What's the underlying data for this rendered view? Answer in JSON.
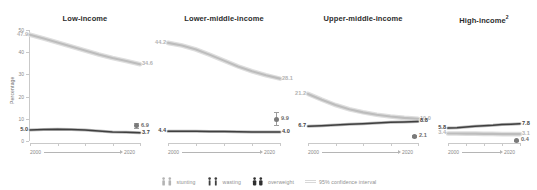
{
  "figure": {
    "ylabel": "Percentage",
    "yticks": [
      0,
      10,
      20,
      30,
      40,
      50
    ],
    "xstart_label": "2000",
    "xend_label": "2020"
  },
  "legend": {
    "items": [
      {
        "label": "stunting",
        "icon": "two-short-people-icon",
        "color": "#b3b3b3"
      },
      {
        "label": "wasting",
        "icon": "two-thin-people-icon",
        "color": "#3f3f3f"
      },
      {
        "label": "overweight",
        "icon": "two-wide-people-icon",
        "color": "#2f2f2f"
      },
      {
        "label": "95% confidence interval",
        "icon": "ci-band-icon",
        "color": "#d8d8d8"
      }
    ]
  },
  "chart_data": {
    "type": "line",
    "title": "",
    "xlabel": "",
    "ylabel": "Percentage",
    "ylim": [
      0,
      50
    ],
    "xlim": [
      2000,
      2020
    ],
    "grid": false,
    "legend_position": "bottom-center",
    "panels": [
      {
        "title": "Low-income",
        "superscript": "",
        "series": [
          {
            "name": "stunting",
            "color": "#bdbdbd",
            "start_label": "47.9",
            "end_label": "34.6",
            "values": [
              47.9,
              46.2,
              44.4,
              42.6,
              40.8,
              39.0,
              37.4,
              36.0,
              34.6
            ]
          },
          {
            "name": "wasting",
            "color": "#3f3f3f",
            "start_label": "5.0",
            "end_label": "3.7",
            "values": [
              5.0,
              5.2,
              5.3,
              5.2,
              4.9,
              4.5,
              4.1,
              3.9,
              3.7
            ]
          }
        ],
        "overweight": {
          "name": "overweight",
          "label": "6.9",
          "value": 6.9,
          "ci_low": 6.0,
          "ci_high": 8.0
        }
      },
      {
        "title": "Lower-middle-income",
        "superscript": "",
        "series": [
          {
            "name": "stunting",
            "color": "#bdbdbd",
            "start_label": "44.2",
            "end_label": "28.1",
            "values": [
              44.2,
              43.0,
              41.2,
              38.8,
              36.2,
              33.6,
              31.4,
              29.6,
              28.1
            ]
          },
          {
            "name": "wasting",
            "color": "#3f3f3f",
            "start_label": "4.4",
            "end_label": "4.0",
            "values": [
              4.4,
              4.4,
              4.4,
              4.3,
              4.3,
              4.2,
              4.1,
              4.0,
              4.0
            ]
          }
        ],
        "overweight": {
          "name": "overweight",
          "label": "9.9",
          "value": 9.9,
          "ci_low": 7.2,
          "ci_high": 13.0
        }
      },
      {
        "title": "Upper-middle-income",
        "superscript": "",
        "series": [
          {
            "name": "stunting",
            "color": "#bdbdbd",
            "start_label": "21.2",
            "end_label": "10.0",
            "values": [
              21.2,
              18.6,
              16.2,
              14.3,
              12.9,
              11.8,
              11.0,
              10.4,
              10.0
            ]
          },
          {
            "name": "wasting",
            "color": "#3f3f3f",
            "start_label": "6.7",
            "end_label": "8.8",
            "values": [
              6.7,
              6.9,
              7.2,
              7.5,
              7.8,
              8.1,
              8.4,
              8.6,
              8.8
            ]
          }
        ],
        "overweight": {
          "name": "overweight",
          "label": "2.1",
          "value": 2.1,
          "ci_low": 1.7,
          "ci_high": 2.5
        }
      },
      {
        "title": "High-income",
        "superscript": "2",
        "series": [
          {
            "name": "wasting",
            "color": "#3f3f3f",
            "start_label": "5.8",
            "end_label": "7.8",
            "values": [
              5.8,
              6.0,
              6.3,
              6.6,
              6.9,
              7.1,
              7.4,
              7.6,
              7.8
            ]
          },
          {
            "name": "stunting",
            "color": "#bdbdbd",
            "start_label": "3.4",
            "end_label": "3.1",
            "values": [
              3.4,
              3.4,
              3.3,
              3.3,
              3.2,
              3.2,
              3.1,
              3.1,
              3.1
            ]
          }
        ],
        "overweight": {
          "name": "overweight",
          "label": "0.4",
          "value": 0.4,
          "ci_low": 0.2,
          "ci_high": 0.6
        }
      }
    ]
  }
}
